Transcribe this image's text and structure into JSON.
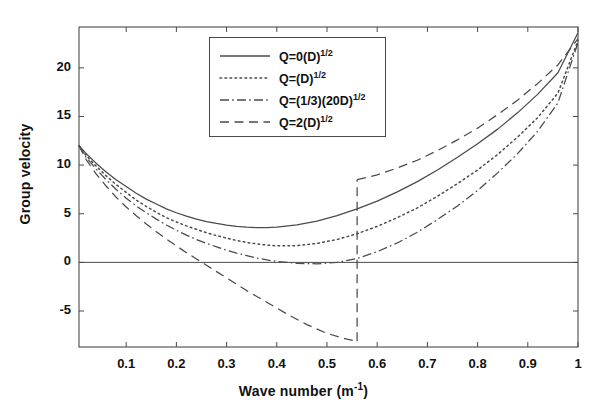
{
  "chart_data": {
    "type": "line",
    "title": "",
    "xlabel": "Wave number (m⁻¹)",
    "xlabel_text": "Wave number (m",
    "xlabel_unit_sup": "-1",
    "xlabel_tail": ")",
    "ylabel": "Group velocity",
    "xlim": [
      0.006,
      1.0
    ],
    "ylim": [
      -8.7,
      24.2
    ],
    "xticks": [
      0.1,
      0.2,
      0.3,
      0.4,
      0.5,
      0.6,
      0.7,
      0.8,
      0.9,
      1
    ],
    "xticklabels": [
      "0.1",
      "0.2",
      "0.3",
      "0.4",
      "0.5",
      "0.6",
      "0.7",
      "0.8",
      "0.9",
      "1"
    ],
    "yticks": [
      -5,
      0,
      5,
      10,
      15,
      20
    ],
    "yticklabels": [
      "-5",
      "0",
      "5",
      "10",
      "15",
      "20"
    ],
    "grid": false,
    "zero_line": true,
    "legend_position": "upper center",
    "line_color": "#4a4a4a",
    "axis_color": "#4a4a4a",
    "series": [
      {
        "name": "Q=0(D)^1/2",
        "label_text": "Q=0(D)",
        "label_sup": "1/2",
        "style": "solid",
        "x": [
          0.006,
          0.02,
          0.04,
          0.06,
          0.08,
          0.1,
          0.12,
          0.14,
          0.16,
          0.18,
          0.2,
          0.22,
          0.24,
          0.26,
          0.28,
          0.3,
          0.32,
          0.34,
          0.36,
          0.38,
          0.4,
          0.44,
          0.48,
          0.52,
          0.56,
          0.6,
          0.64,
          0.68,
          0.72,
          0.76,
          0.8,
          0.84,
          0.88,
          0.92,
          0.96,
          1.0
        ],
        "y": [
          12.0,
          11.2,
          10.2,
          9.3,
          8.5,
          7.8,
          7.1,
          6.5,
          6.0,
          5.5,
          5.1,
          4.75,
          4.45,
          4.2,
          4.0,
          3.83,
          3.7,
          3.62,
          3.58,
          3.58,
          3.62,
          3.85,
          4.25,
          4.8,
          5.5,
          6.3,
          7.25,
          8.3,
          9.5,
          10.8,
          12.2,
          13.7,
          15.4,
          17.3,
          19.5,
          23.6
        ]
      },
      {
        "name": "Q=(D)^1/2",
        "label_text": "Q=(D)",
        "label_sup": "1/2",
        "style": "dotted",
        "x": [
          0.006,
          0.02,
          0.04,
          0.06,
          0.08,
          0.1,
          0.12,
          0.14,
          0.16,
          0.18,
          0.2,
          0.22,
          0.24,
          0.26,
          0.28,
          0.3,
          0.32,
          0.34,
          0.36,
          0.38,
          0.4,
          0.44,
          0.48,
          0.52,
          0.56,
          0.6,
          0.64,
          0.68,
          0.72,
          0.76,
          0.8,
          0.84,
          0.88,
          0.92,
          0.96,
          1.0
        ],
        "y": [
          12.0,
          11.0,
          9.9,
          8.9,
          8.0,
          7.2,
          6.4,
          5.75,
          5.15,
          4.6,
          4.15,
          3.75,
          3.4,
          3.05,
          2.75,
          2.5,
          2.25,
          2.05,
          1.9,
          1.78,
          1.7,
          1.72,
          1.95,
          2.35,
          2.95,
          3.7,
          4.6,
          5.6,
          6.8,
          8.1,
          9.5,
          11.1,
          12.9,
          14.9,
          17.4,
          22.8
        ]
      },
      {
        "name": "Q=(1/3)(20D)^1/2",
        "label_text": "Q=(1/3)(20D)",
        "label_sup": "1/2",
        "style": "dashdot",
        "x": [
          0.006,
          0.02,
          0.04,
          0.06,
          0.08,
          0.1,
          0.12,
          0.14,
          0.16,
          0.18,
          0.2,
          0.22,
          0.24,
          0.26,
          0.28,
          0.3,
          0.32,
          0.34,
          0.36,
          0.38,
          0.4,
          0.44,
          0.48,
          0.52,
          0.56,
          0.6,
          0.64,
          0.68,
          0.72,
          0.76,
          0.8,
          0.84,
          0.88,
          0.92,
          0.96,
          1.0
        ],
        "y": [
          12.0,
          10.8,
          9.6,
          8.5,
          7.5,
          6.6,
          5.8,
          5.1,
          4.45,
          3.85,
          3.3,
          2.8,
          2.35,
          1.95,
          1.6,
          1.25,
          0.95,
          0.7,
          0.45,
          0.25,
          0.1,
          -0.1,
          -0.15,
          0.0,
          0.4,
          1.1,
          2.0,
          3.1,
          4.4,
          5.8,
          7.4,
          9.2,
          11.2,
          13.5,
          16.4,
          22.6
        ]
      },
      {
        "name": "Q=2(D)^1/2",
        "label_text": "Q=2(D)",
        "label_sup": "1/2",
        "style": "dashed",
        "branches": [
          {
            "x": [
              0.006,
              0.02,
              0.04,
              0.06,
              0.08,
              0.1,
              0.12,
              0.14,
              0.16,
              0.18,
              0.2,
              0.22,
              0.24,
              0.26,
              0.28,
              0.3,
              0.34,
              0.38,
              0.42,
              0.46,
              0.5,
              0.54,
              0.56
            ],
            "y": [
              12.0,
              10.6,
              9.1,
              7.85,
              6.7,
              5.7,
              4.8,
              3.95,
              3.15,
              2.4,
              1.7,
              1.0,
              0.35,
              -0.3,
              -0.95,
              -1.6,
              -2.9,
              -4.1,
              -5.3,
              -6.4,
              -7.3,
              -7.9,
              -8.1
            ]
          },
          {
            "x": [
              0.56,
              0.56
            ],
            "y": [
              -8.1,
              8.5
            ]
          },
          {
            "x": [
              0.56,
              0.6,
              0.64,
              0.68,
              0.72,
              0.76,
              0.8,
              0.84,
              0.88,
              0.92,
              0.96,
              1.0
            ],
            "y": [
              8.5,
              9.0,
              9.7,
              10.5,
              11.5,
              12.6,
              13.8,
              15.2,
              16.7,
              18.4,
              20.3,
              23.0
            ]
          }
        ]
      }
    ]
  }
}
